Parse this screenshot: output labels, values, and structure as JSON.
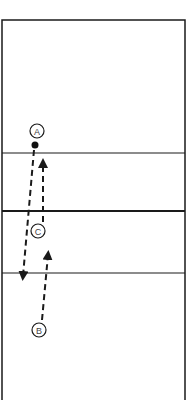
{
  "diagram": {
    "type": "volleyball-court-drill",
    "colors": {
      "line": "#1a1a1a",
      "background": "#ffffff"
    },
    "players": [
      {
        "id": "A",
        "label": "A",
        "cx": 37,
        "cy": 131
      },
      {
        "id": "C",
        "label": "C",
        "cx": 38,
        "cy": 231
      },
      {
        "id": "B",
        "label": "B",
        "cx": 39,
        "cy": 330
      }
    ],
    "ball": {
      "cx": 35,
      "cy": 145
    },
    "lines": {
      "attack_line_top_y": 153,
      "net_y": 211,
      "attack_line_bottom_y": 273
    }
  }
}
